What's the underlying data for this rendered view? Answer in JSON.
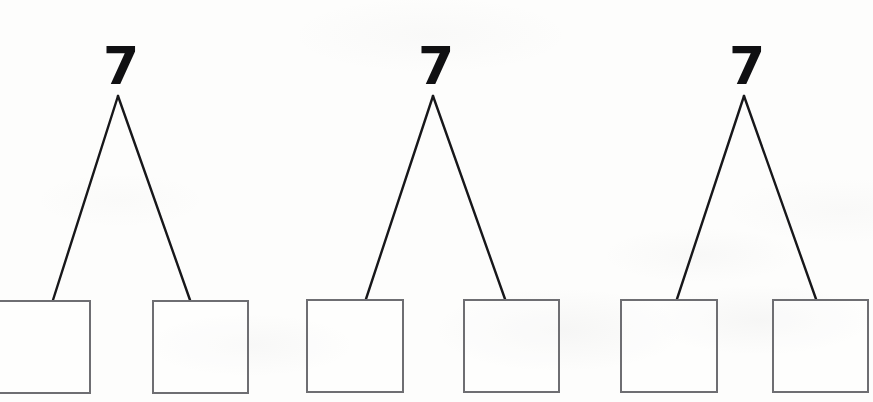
{
  "page": {
    "width": 873,
    "height": 402,
    "background_color": "#fdfdfc"
  },
  "style": {
    "number_color": "#101012",
    "box_border_color": "#6e6e72",
    "connector_color": "#17171a",
    "box_fill_color": "#ffffff"
  },
  "bonds": [
    {
      "id": "bond-1",
      "whole_label": "7",
      "whole_x": 103,
      "whole_y": 40,
      "apex_x": 118,
      "apex_y": 96,
      "left_box": {
        "label": "",
        "x": -8,
        "y": 300,
        "width": 99,
        "height": 94,
        "anchor_x": 53,
        "anchor_y": 300
      },
      "right_box": {
        "label": "",
        "x": 152,
        "y": 300,
        "width": 97,
        "height": 94,
        "anchor_x": 190,
        "anchor_y": 300
      }
    },
    {
      "id": "bond-2",
      "whole_label": "7",
      "whole_x": 418,
      "whole_y": 40,
      "apex_x": 433,
      "apex_y": 96,
      "left_box": {
        "label": "",
        "x": 306,
        "y": 299,
        "width": 98,
        "height": 94,
        "anchor_x": 366,
        "anchor_y": 299
      },
      "right_box": {
        "label": "",
        "x": 463,
        "y": 299,
        "width": 97,
        "height": 94,
        "anchor_x": 505,
        "anchor_y": 299
      }
    },
    {
      "id": "bond-3",
      "whole_label": "7",
      "whole_x": 729,
      "whole_y": 40,
      "apex_x": 744,
      "apex_y": 96,
      "left_box": {
        "label": "",
        "x": 620,
        "y": 299,
        "width": 98,
        "height": 94,
        "anchor_x": 677,
        "anchor_y": 299
      },
      "right_box": {
        "label": "",
        "x": 772,
        "y": 299,
        "width": 97,
        "height": 94,
        "anchor_x": 816,
        "anchor_y": 299
      }
    }
  ]
}
